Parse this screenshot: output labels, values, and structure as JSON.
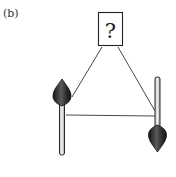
{
  "figure": {
    "panel_label": "(b)",
    "question_box": {
      "text": "?"
    },
    "spins": [
      {
        "id": "left",
        "orientation": "up"
      },
      {
        "id": "right",
        "orientation": "down"
      }
    ],
    "connections": [
      {
        "from": "question_box",
        "to": "left"
      },
      {
        "from": "question_box",
        "to": "right"
      },
      {
        "from": "left",
        "to": "right"
      }
    ],
    "colors": {
      "line": "#333333",
      "cone_dark": "#1e1e1e",
      "cone_mid": "#555555",
      "rod_fill": "#d8d8d8",
      "rod_stroke": "#2a2a2a",
      "background": "#ffffff"
    }
  }
}
